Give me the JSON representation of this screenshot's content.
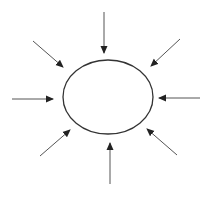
{
  "diagram": {
    "type": "inward-arrows-to-ellipse",
    "width": 209,
    "height": 199,
    "background": "#ffffff",
    "stroke_color": "#333333",
    "arrow_color": "#555555",
    "ellipse": {
      "cx": 108,
      "cy": 97,
      "rx": 45,
      "ry": 37
    },
    "arrows": [
      {
        "id": "top",
        "x1": 104,
        "y1": 12,
        "x2": 104,
        "y2": 53
      },
      {
        "id": "top-right",
        "x1": 180,
        "y1": 39,
        "x2": 151,
        "y2": 66
      },
      {
        "id": "right",
        "x1": 200,
        "y1": 98,
        "x2": 159,
        "y2": 98
      },
      {
        "id": "bottom-right",
        "x1": 177,
        "y1": 155,
        "x2": 147,
        "y2": 129
      },
      {
        "id": "bottom",
        "x1": 110,
        "y1": 184,
        "x2": 110,
        "y2": 143
      },
      {
        "id": "bottom-left",
        "x1": 40,
        "y1": 156,
        "x2": 70,
        "y2": 130
      },
      {
        "id": "left",
        "x1": 12,
        "y1": 99,
        "x2": 53,
        "y2": 99
      },
      {
        "id": "top-left",
        "x1": 33,
        "y1": 41,
        "x2": 63,
        "y2": 67
      }
    ]
  }
}
